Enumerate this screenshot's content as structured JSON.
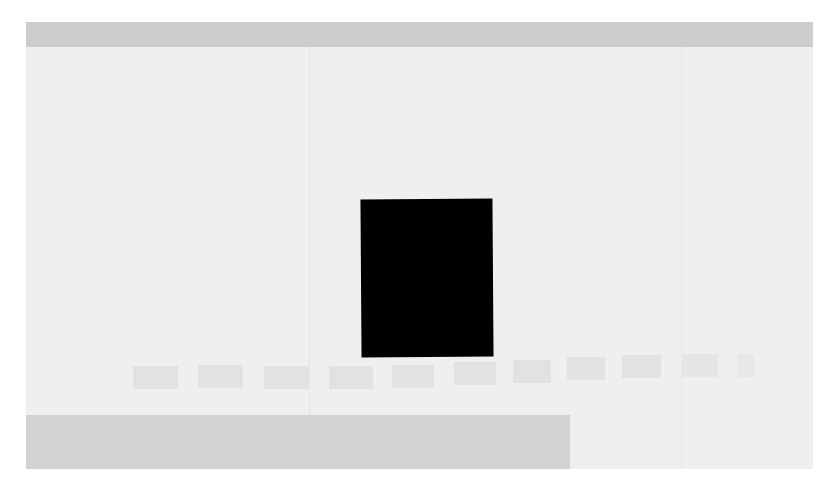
{
  "window": {
    "title": "",
    "header_color": "#cdcdcd",
    "background_color": "#efefef"
  },
  "viewer": {
    "media": {
      "icon": "media-frame",
      "color": "#000000"
    }
  },
  "thumbnail_strip": {
    "count": 11,
    "items": [
      {
        "label": ""
      },
      {
        "label": ""
      },
      {
        "label": ""
      },
      {
        "label": ""
      },
      {
        "label": ""
      },
      {
        "label": ""
      },
      {
        "label": ""
      },
      {
        "label": ""
      },
      {
        "label": ""
      },
      {
        "label": ""
      },
      {
        "label": ""
      }
    ]
  },
  "bottom_panel": {
    "text": "",
    "color": "#d2d2d2"
  }
}
